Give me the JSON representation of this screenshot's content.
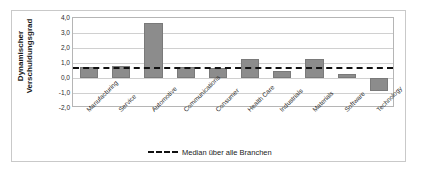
{
  "chart_data": {
    "type": "bar",
    "title": "",
    "xlabel": "",
    "ylabel": "Dynamischer\nVerschuldungsgrad",
    "ylim": [
      -2.0,
      4.0
    ],
    "ytick_labels": [
      "4,0",
      "3,0",
      "2,0",
      "1,0",
      "0,0",
      "-1,0",
      "-2,0"
    ],
    "ytick_values": [
      4.0,
      3.0,
      2.0,
      1.0,
      0.0,
      -1.0,
      -2.0
    ],
    "grid": true,
    "legend_position": "bottom-center",
    "categories": [
      "Manufacturing",
      "Service",
      "Automotive",
      "Communications",
      "Consumer",
      "Health Care",
      "Industrials",
      "Materials",
      "Software",
      "Technology"
    ],
    "values": [
      0.75,
      0.8,
      3.7,
      0.75,
      0.65,
      1.3,
      0.45,
      1.3,
      0.25,
      -0.85
    ],
    "series": [
      {
        "name": "Dynamischer Verschuldungsgrad",
        "values": [
          0.75,
          0.8,
          3.7,
          0.75,
          0.65,
          1.3,
          0.45,
          1.3,
          0.25,
          -0.85
        ],
        "color": "#8c8c8c"
      }
    ],
    "reference_line": {
      "label": "Median über alle Branchen",
      "value": 0.75,
      "style": "dashed",
      "color": "#111111"
    },
    "legend": [
      {
        "label": "Median über alle Branchen",
        "marker": "dashed-line"
      }
    ]
  }
}
